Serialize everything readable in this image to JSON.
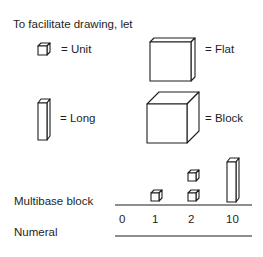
{
  "intro": "To facilitate drawing, let",
  "legend": [
    {
      "icon": "unit-cube-icon",
      "label": "= Unit"
    },
    {
      "icon": "flat-icon",
      "label": "= Flat"
    },
    {
      "icon": "long-rod-icon",
      "label": "= Long"
    },
    {
      "icon": "block-icon",
      "label": "= Block"
    }
  ],
  "table": {
    "row_labels": {
      "blocks": "Multibase block",
      "numerals": "Numeral"
    },
    "columns": [
      {
        "numeral": "0",
        "blocks": "none"
      },
      {
        "numeral": "1",
        "blocks": "1 unit"
      },
      {
        "numeral": "2",
        "blocks": "2 units"
      },
      {
        "numeral": "10",
        "blocks": "1 long"
      }
    ]
  }
}
